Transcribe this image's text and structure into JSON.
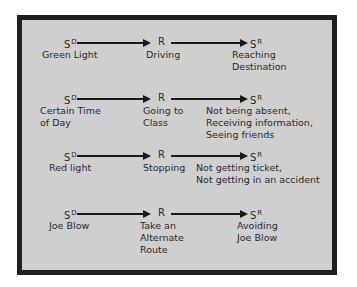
{
  "diagram": {
    "symbols": {
      "sd_base": "S",
      "sd_sup": "D",
      "r": "R",
      "sr_base": "S",
      "sr_sup": "R"
    },
    "rows": [
      {
        "sd_label": "Green Light",
        "r_label": "Driving",
        "sr_label": "Reaching\nDestination"
      },
      {
        "sd_label": "Certain Time\nof Day",
        "r_label": "Going to\nClass",
        "sr_label": "Not being absent,\nReceiving information,\nSeeing friends"
      },
      {
        "sd_label": "Red light",
        "r_label": "Stopping",
        "sr_label": "Not getting ticket,\nNot getting in an accident"
      },
      {
        "sd_label": "Joe Blow",
        "r_label": "Take an\nAlternate\nRoute",
        "sr_label": "Avoiding\nJoe Blow"
      }
    ]
  }
}
